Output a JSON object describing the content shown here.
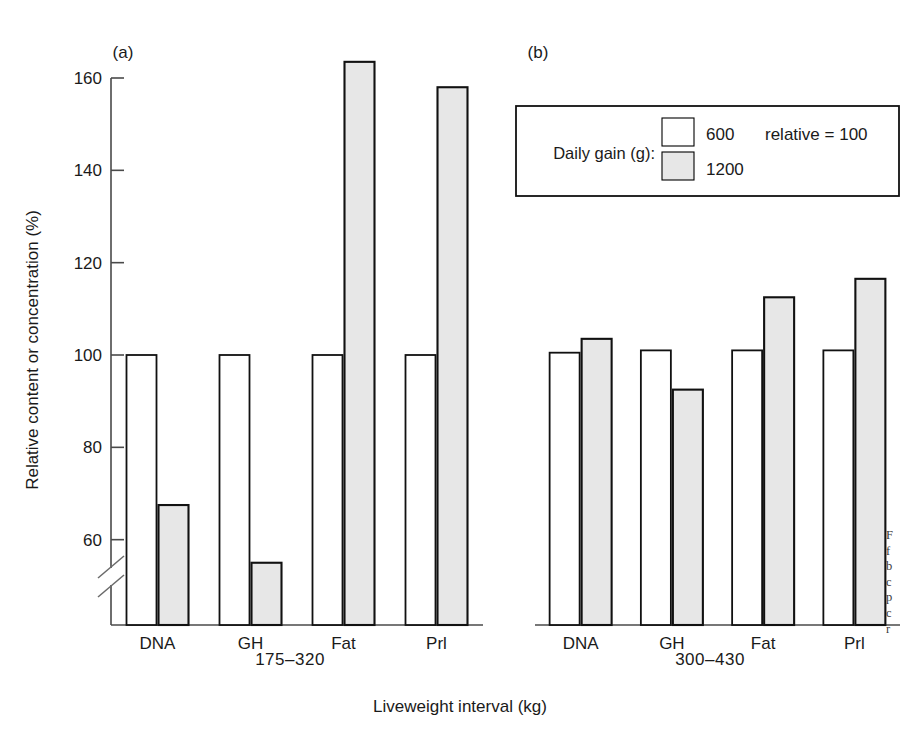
{
  "figure": {
    "background": "#ffffff",
    "ink_color": "#111111",
    "fill_color": "#e7e7e7"
  },
  "axis": {
    "y_title": "Relative content or concentration (%)",
    "x_title": "Liveweight interval (kg)",
    "y_ticks": [
      160,
      140,
      120,
      100,
      80,
      60
    ],
    "y_tick_labels": [
      "160",
      "140",
      "120",
      "100",
      "80",
      "60"
    ],
    "y_break": true,
    "y_min_display": 48,
    "y_max_display": 168
  },
  "legend": {
    "title": "Daily gain (g):",
    "entries": [
      {
        "label": "600",
        "swatch": "open",
        "note": "relative  =  100"
      },
      {
        "label": "1200",
        "swatch": "filled",
        "note": ""
      }
    ]
  },
  "panels": [
    {
      "key": "a",
      "label": "(a)",
      "interval": "175–320"
    },
    {
      "key": "b",
      "label": "(b)",
      "interval": "300–430"
    }
  ],
  "caption_fragment": {
    "lines": [
      "F",
      "f",
      "b",
      "c",
      "p",
      "c",
      "r"
    ]
  },
  "chart_data": {
    "type": "bar",
    "title": "",
    "xlabel": "Liveweight interval (kg)",
    "ylabel": "Relative content or concentration (%)",
    "ylim": [
      48,
      168
    ],
    "y_axis_break_below": 60,
    "grid": false,
    "legend_position": "top-right",
    "legend_title": "Daily gain (g):",
    "reference_note": "relative = 100",
    "categories": [
      "DNA",
      "GH",
      "Fat",
      "Prl"
    ],
    "panels": [
      {
        "panel": "(a)",
        "interval": "175-320",
        "categories": [
          "DNA",
          "GH",
          "Fat",
          "Prl"
        ],
        "series": [
          {
            "name": "600",
            "style": "open",
            "values": [
              100,
              100,
              100,
              100
            ]
          },
          {
            "name": "1200",
            "style": "filled",
            "values": [
              67.5,
              55,
              163.5,
              158
            ]
          }
        ]
      },
      {
        "panel": "(b)",
        "interval": "300-430",
        "categories": [
          "DNA",
          "GH",
          "Fat",
          "Prl"
        ],
        "series": [
          {
            "name": "600",
            "style": "open",
            "values": [
              100.5,
              101,
              101,
              101
            ]
          },
          {
            "name": "1200",
            "style": "filled",
            "values": [
              103.5,
              92.5,
              112.5,
              116.5
            ]
          }
        ]
      }
    ]
  }
}
